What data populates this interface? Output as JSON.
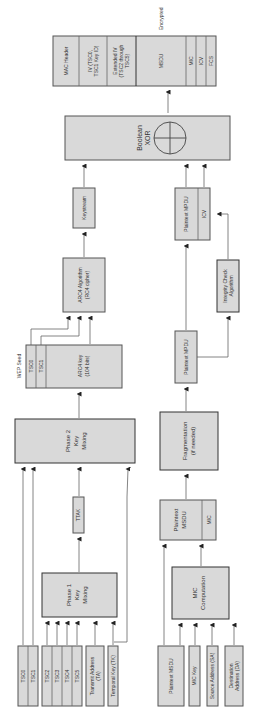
{
  "diagram": {
    "colors": {
      "box_fill": "#d9d9d9",
      "box_stroke": "#555555",
      "line": "#666666",
      "text": "#333333"
    },
    "output_frame": {
      "encrypted_label": "Encrypted",
      "fields": [
        "MAC Header",
        "IV (TSC0, TSC1 Key ID)",
        "Extended IV (TSC2 through TSC5)",
        "MSDU",
        "MIC",
        "ICV",
        "FCS"
      ],
      "iv_line1": "IV (TSC0,",
      "iv_line2": "TSC1 Key ID)",
      "extiv_line1": "Extended IV",
      "extiv_line2": "(TSC2 through",
      "extiv_line3": "TSC5)"
    },
    "xor": {
      "line1": "Boolean",
      "line2": "XOR"
    },
    "keystream": "Keystream",
    "plaintext_mpdu_icv": {
      "mpdu": "Plaintext MPDU",
      "icv": "ICV"
    },
    "arc4_algorithm": {
      "line1": "ARC4 Algorithm",
      "line2": "(RC4 cipher)"
    },
    "integrity_check": {
      "line1": "Integrity Check",
      "line2": "Algorithm"
    },
    "wep_seed": {
      "label": "WEP Seed",
      "tsc0": "TSC0",
      "tsc1": "TSC1",
      "key_line1": "ARC4 key",
      "key_line2": "(104 bits)"
    },
    "phase2": {
      "line1": "Phase 2",
      "line2": "Key",
      "line3": "Mixing"
    },
    "plaintext_mpdu": "Plaintext MPDU",
    "fragmentation": {
      "line1": "Fragmentation",
      "line2": "(if needed)"
    },
    "ttak": "TTAK",
    "phase1": {
      "line1": "Phase 1",
      "line2": "Key",
      "line3": "Mixing"
    },
    "plaintext_msdu_mic": {
      "line1": "Plaintext",
      "line2": "MSDU",
      "mic": "MIC"
    },
    "mic_computation": {
      "line1": "MIC",
      "line2": "Computation"
    },
    "inputs_left": {
      "tsc0": "TSC0",
      "tsc1": "TSC1",
      "tsc2": "TSC2",
      "tsc3": "TSC3",
      "tsc4": "TSC4",
      "tsc5": "TSC5",
      "ta_line1": "Transmit Address",
      "ta_line2": "(TA)",
      "tk": "Temporal Key (TK)"
    },
    "inputs_right": {
      "plaintext_msdu": "Plaintext MSDU",
      "mic_key": "MIC Key",
      "sa": "Source Address (SA)",
      "da_line1": "Destination",
      "da_line2": "Address (DA)"
    }
  }
}
